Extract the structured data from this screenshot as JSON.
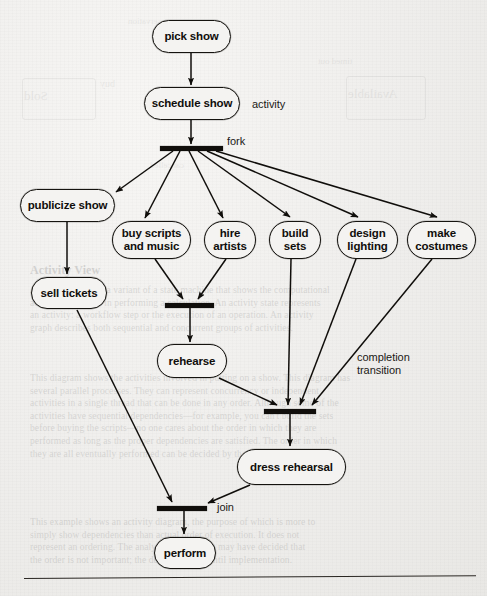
{
  "diagram": {
    "type": "uml-activity-diagram",
    "nodes": [
      {
        "id": "pick-show",
        "label": "pick show",
        "kind": "activity",
        "x": 152,
        "y": 20,
        "w": 79,
        "h": 33
      },
      {
        "id": "schedule-show",
        "label": "schedule show",
        "kind": "activity",
        "x": 144,
        "y": 87,
        "w": 96,
        "h": 33
      },
      {
        "id": "publicize-show",
        "label": "publicize show",
        "kind": "activity",
        "x": 20,
        "y": 189,
        "w": 95,
        "h": 33
      },
      {
        "id": "sell-tickets",
        "label": "sell tickets",
        "kind": "activity",
        "x": 31,
        "y": 277,
        "w": 76,
        "h": 32
      },
      {
        "id": "buy-scripts",
        "label": "buy scripts\nand music",
        "kind": "activity",
        "x": 112,
        "y": 221,
        "w": 79,
        "h": 38
      },
      {
        "id": "hire-artists",
        "label": "hire\nartists",
        "kind": "activity",
        "x": 204,
        "y": 221,
        "w": 52,
        "h": 38
      },
      {
        "id": "build-sets",
        "label": "build\nsets",
        "kind": "activity",
        "x": 269,
        "y": 221,
        "w": 52,
        "h": 38
      },
      {
        "id": "design-lighting",
        "label": "design\nlighting",
        "kind": "activity",
        "x": 337,
        "y": 221,
        "w": 61,
        "h": 38
      },
      {
        "id": "make-costumes",
        "label": "make\ncostumes",
        "kind": "activity",
        "x": 407,
        "y": 221,
        "w": 69,
        "h": 38
      },
      {
        "id": "rehearse",
        "label": "rehearse",
        "kind": "activity",
        "x": 157,
        "y": 344,
        "w": 70,
        "h": 34
      },
      {
        "id": "dress-rehearsal",
        "label": "dress rehearsal",
        "kind": "activity",
        "x": 237,
        "y": 449,
        "w": 109,
        "h": 36
      },
      {
        "id": "perform",
        "label": "perform",
        "kind": "activity",
        "x": 154,
        "y": 537,
        "w": 62,
        "h": 32
      }
    ],
    "bars": [
      {
        "id": "fork-bar",
        "kind": "fork",
        "x": 160,
        "y": 146,
        "w": 63,
        "h": 5
      },
      {
        "id": "join-bar-1",
        "kind": "join",
        "x": 165,
        "y": 303,
        "w": 49,
        "h": 5
      },
      {
        "id": "join-bar-2",
        "kind": "join",
        "x": 264,
        "y": 409,
        "w": 52,
        "h": 5
      },
      {
        "id": "join-bar-3",
        "kind": "join",
        "x": 157,
        "y": 506,
        "w": 50,
        "h": 5
      }
    ],
    "annotations": [
      {
        "id": "activity-label",
        "text": "activity",
        "x": 252,
        "y": 98
      },
      {
        "id": "fork-label",
        "text": "fork",
        "x": 227,
        "y": 135
      },
      {
        "id": "completion-label",
        "text": "completion\ntransition",
        "x": 357,
        "y": 351
      },
      {
        "id": "join-label",
        "text": "join",
        "x": 217,
        "y": 501
      }
    ],
    "edges": [
      {
        "from": "pick-show",
        "to": "schedule-show"
      },
      {
        "from": "schedule-show",
        "to": "fork-bar"
      },
      {
        "from": "fork-bar",
        "to": "publicize-show"
      },
      {
        "from": "fork-bar",
        "to": "buy-scripts"
      },
      {
        "from": "fork-bar",
        "to": "hire-artists"
      },
      {
        "from": "fork-bar",
        "to": "build-sets"
      },
      {
        "from": "fork-bar",
        "to": "design-lighting"
      },
      {
        "from": "fork-bar",
        "to": "make-costumes"
      },
      {
        "from": "publicize-show",
        "to": "sell-tickets"
      },
      {
        "from": "buy-scripts",
        "to": "join-bar-1"
      },
      {
        "from": "hire-artists",
        "to": "join-bar-1"
      },
      {
        "from": "join-bar-1",
        "to": "rehearse"
      },
      {
        "from": "rehearse",
        "to": "join-bar-2"
      },
      {
        "from": "build-sets",
        "to": "join-bar-2"
      },
      {
        "from": "design-lighting",
        "to": "join-bar-2"
      },
      {
        "from": "make-costumes",
        "to": "join-bar-2"
      },
      {
        "from": "join-bar-2",
        "to": "dress-rehearsal"
      },
      {
        "from": "dress-rehearsal",
        "to": "join-bar-3"
      },
      {
        "from": "sell-tickets",
        "to": "join-bar-3"
      },
      {
        "from": "join-bar-3",
        "to": "perform"
      }
    ],
    "colors": {
      "ink": "#100e0b",
      "paper": "#f1f0ee",
      "node_fill": "#f4f3f1"
    }
  },
  "bleed_through": {
    "note": "faint mirrored text showing through from the reverse side of the page",
    "items": [
      {
        "text": "Available",
        "x": 352,
        "y": 95,
        "size": 13
      },
      {
        "text": "Sold",
        "x": 24,
        "y": 96,
        "size": 13
      },
      {
        "text": "timed out",
        "x": 318,
        "y": 62,
        "size": 9
      },
      {
        "text": "buy",
        "x": 100,
        "y": 84,
        "size": 10
      },
      {
        "text": "cancelled",
        "x": 150,
        "y": 165,
        "size": 9
      },
      {
        "text": "reservation",
        "x": 130,
        "y": 22,
        "size": 9
      }
    ]
  },
  "page_text": {
    "heading": "Activity View",
    "paragraphs": [
      "An activity view is a variant of a state machine that shows the computational activities involved in performing a calculation. An activity state represents an activity: a workflow step or the execution of an operation. An activity graph describes both",
      "sequential and concurrent groups of activities. This diagram shows the activities involved in putting on a show. This diagram has several parallel processes. They can represent concurrency or independent activities in a single thread that can be done in any order. Although some of the activities have sequential dependencies—for example, you can't build the sets before buying the scripts—no one cares about the order in which they are performed as long as the proper dependencies are satisfied.",
      "This example shows an activity diagram, the purpose of which is more to simply show dependencies than actual order of execution."
    ]
  }
}
